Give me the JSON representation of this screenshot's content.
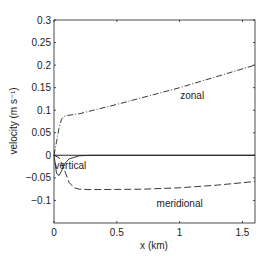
{
  "chart_data": {
    "type": "line",
    "title": "",
    "xlabel": "x (km)",
    "ylabel": "velocity (m s⁻¹)",
    "xlim": [
      0,
      1.6
    ],
    "ylim": [
      -0.15,
      0.3
    ],
    "xticks": [
      0,
      0.5,
      1,
      1.5
    ],
    "xtick_labels": [
      "0",
      "0.5",
      "1",
      "1.5"
    ],
    "yticks": [
      0.3,
      0.25,
      0.2,
      0.15,
      0.1,
      0.05,
      0,
      -0.05,
      -0.1
    ],
    "ytick_labels": [
      "0.3",
      "0.25",
      "0.2",
      "0.15",
      "0.1",
      "0.05",
      "0",
      "−0.05",
      "−0.1"
    ],
    "grid": false,
    "legend": "inline annotations",
    "series": [
      {
        "name": "zonal",
        "style": "dash-dot",
        "x": [
          0,
          0.02,
          0.04,
          0.06,
          0.08,
          0.1,
          0.2,
          0.5,
          1.0,
          1.6
        ],
        "y": [
          0,
          0.03,
          0.06,
          0.08,
          0.086,
          0.088,
          0.092,
          0.113,
          0.15,
          0.2
        ]
      },
      {
        "name": "vertical",
        "style": "solid",
        "x": [
          0,
          0.01,
          0.02,
          0.04,
          0.06,
          0.08,
          0.12,
          0.2,
          0.3,
          1.6
        ],
        "y": [
          0,
          -0.02,
          -0.04,
          -0.045,
          -0.035,
          -0.02,
          -0.008,
          -0.001,
          0,
          0
        ]
      },
      {
        "name": "meridional",
        "style": "dashed",
        "x": [
          0,
          0.04,
          0.08,
          0.12,
          0.16,
          0.2,
          0.3,
          0.7,
          1.0,
          1.3,
          1.6
        ],
        "y": [
          0,
          -0.005,
          -0.03,
          -0.06,
          -0.072,
          -0.075,
          -0.076,
          -0.075,
          -0.072,
          -0.066,
          -0.058
        ]
      },
      {
        "name": "zero line",
        "style": "solid",
        "x": [
          0,
          1.6
        ],
        "y": [
          0,
          0
        ]
      }
    ],
    "annotations": [
      {
        "text": "zonal",
        "x": 1.1,
        "y": 0.125
      },
      {
        "text": "vertical",
        "x": 0.13,
        "y": -0.03
      },
      {
        "text": "meridional",
        "x": 1.0,
        "y": -0.115
      }
    ]
  },
  "labels": {
    "xlabel": "x (km)",
    "ylabel": "velocity (m s⁻¹)",
    "zonal": "zonal",
    "vertical": "vertical",
    "meridional": "meridional"
  }
}
